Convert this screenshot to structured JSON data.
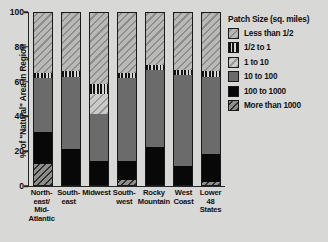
{
  "chart_data": {
    "type": "bar",
    "subtype": "stacked-bar-100",
    "title": "",
    "xlabel": "",
    "ylabel": "% of \"Natural\" Area in Region",
    "ylim": [
      0,
      100
    ],
    "yticks": [
      0,
      20,
      40,
      60,
      80,
      100
    ],
    "grid": false,
    "legend_position": "right",
    "legend_title": "Patch Size (sq. miles)",
    "categories": [
      "North-\neast/\nMid-\nAtlantic",
      "South-\neast",
      "Midwest",
      "South-\nwest",
      "Rocky\nMountain",
      "West\nCoast",
      "Lower\n48 States"
    ],
    "series": [
      {
        "name": "More than 1000",
        "pattern": "p-gt-1000",
        "values": [
          12,
          0,
          0,
          3,
          0,
          0,
          2
        ]
      },
      {
        "name": "100 to 1000",
        "pattern": "p-100-1000",
        "values": [
          19,
          21,
          14,
          11,
          22,
          11,
          16
        ]
      },
      {
        "name": "10 to 100",
        "pattern": "p-10-100",
        "values": [
          31,
          42,
          27,
          48,
          45,
          53,
          45
        ]
      },
      {
        "name": "1 to 10",
        "pattern": "p-1-10",
        "values": [
          0,
          0,
          12,
          0,
          0,
          0,
          0
        ]
      },
      {
        "name": "1/2 to 1",
        "pattern": "p-half-1",
        "values": [
          3,
          3,
          6,
          3,
          3,
          3,
          3
        ]
      },
      {
        "name": "Less than 1/2",
        "pattern": "p-lt-half",
        "values": [
          35,
          34,
          41,
          35,
          30,
          33,
          34
        ]
      }
    ],
    "legend_entries": [
      {
        "label": "Less than 1/2",
        "pattern": "p-lt-half"
      },
      {
        "label": "1/2 to 1",
        "pattern": "p-half-1"
      },
      {
        "label": "1 to 10",
        "pattern": "p-1-10"
      },
      {
        "label": "10 to 100",
        "pattern": "p-10-100"
      },
      {
        "label": "100 to 1000",
        "pattern": "p-100-1000"
      },
      {
        "label": "More than 1000",
        "pattern": "p-gt-1000"
      }
    ],
    "colors": {
      "background": "#d8d8d6",
      "axis": "#262626",
      "solid_mid_gray": "#6b6b6b",
      "solid_black": "#080808",
      "text": "#111111"
    }
  }
}
